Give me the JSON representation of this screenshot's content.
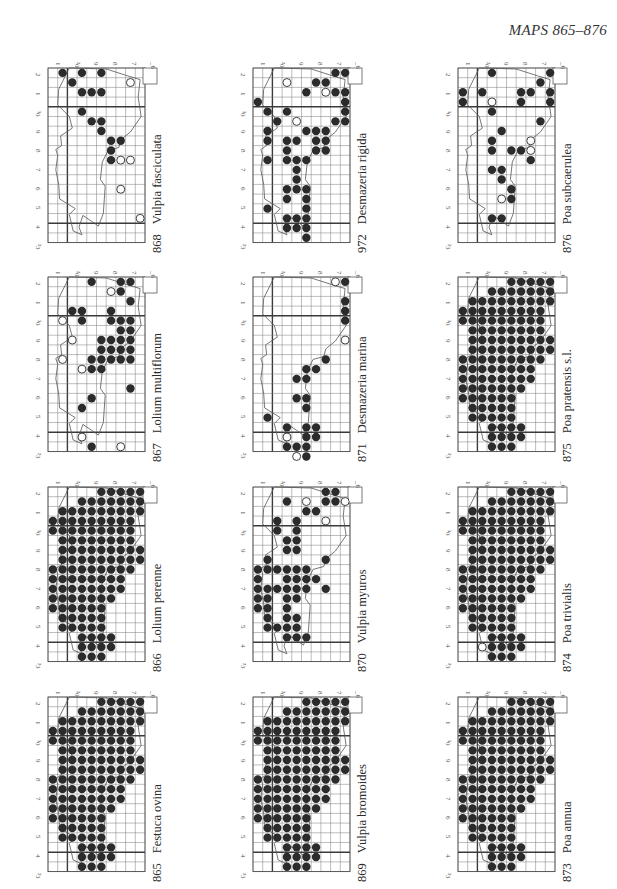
{
  "page": {
    "header": "MAPS 865–876",
    "colors": {
      "dot": "#2b2b2b",
      "grid": "#7a7a7a",
      "major_grid": "#3a3a3a",
      "coast": "#555555",
      "background": "#ffffff"
    }
  },
  "axes": {
    "left_labels": [
      "2",
      "1",
      "³0",
      "9",
      "8",
      "7",
      "6",
      "5",
      "4",
      "²3"
    ],
    "top_labels": [
      "1",
      "²0",
      "9",
      "8",
      "7",
      "_6"
    ]
  },
  "legend": {
    "filled_dot": "recorded (recent)",
    "open_dot": "recorded (old)"
  },
  "maps": [
    {
      "id": "868",
      "number": "868",
      "species": "Vulpia fasciculata",
      "col": 0,
      "row": 0,
      "filled": [
        [
          5,
          0
        ],
        [
          2,
          1
        ],
        [
          3,
          0
        ],
        [
          1,
          0
        ],
        [
          3,
          2
        ],
        [
          4,
          2
        ],
        [
          5,
          2
        ],
        [
          3,
          4
        ],
        [
          5,
          5
        ],
        [
          4,
          5
        ],
        [
          5,
          6
        ],
        [
          6,
          7
        ],
        [
          7,
          7
        ],
        [
          6,
          8
        ],
        [
          6,
          9
        ]
      ],
      "open": [
        [
          7,
          9
        ],
        [
          8,
          9
        ],
        [
          7,
          12
        ],
        [
          8,
          1
        ],
        [
          9,
          15
        ]
      ]
    },
    {
      "id": "867",
      "number": "867",
      "species": "Lolium multiflorum",
      "col": 0,
      "row": 1,
      "filled": [
        [
          4,
          17
        ],
        [
          3,
          13
        ],
        [
          4,
          12
        ],
        [
          4,
          9
        ],
        [
          5,
          9
        ],
        [
          4,
          8
        ],
        [
          5,
          8
        ],
        [
          6,
          8
        ],
        [
          7,
          8
        ],
        [
          8,
          8
        ],
        [
          8,
          11
        ],
        [
          5,
          7
        ],
        [
          6,
          7
        ],
        [
          7,
          7
        ],
        [
          8,
          7
        ],
        [
          5,
          6
        ],
        [
          6,
          6
        ],
        [
          7,
          6
        ],
        [
          8,
          6
        ],
        [
          7,
          5
        ],
        [
          8,
          5
        ],
        [
          3,
          4
        ],
        [
          6,
          4
        ],
        [
          7,
          4
        ],
        [
          8,
          4
        ],
        [
          2,
          3
        ],
        [
          3,
          3
        ],
        [
          6,
          3
        ],
        [
          8,
          2
        ],
        [
          7,
          1
        ],
        [
          8,
          0
        ],
        [
          4,
          0
        ],
        [
          7,
          0
        ]
      ],
      "open": [
        [
          1,
          8
        ],
        [
          2,
          6
        ],
        [
          1,
          4
        ],
        [
          3,
          9
        ],
        [
          7,
          17
        ],
        [
          3,
          16
        ],
        [
          6,
          1
        ]
      ]
    },
    {
      "id": "866",
      "number": "866",
      "species": "Lolium perenne",
      "col": 0,
      "row": 2,
      "dense": true
    },
    {
      "id": "865",
      "number": "865",
      "species": "Festuca ovina",
      "col": 0,
      "row": 3,
      "dense": true
    },
    {
      "id": "972",
      "number": "972",
      "species": "Desmazeria rigida",
      "col": 1,
      "row": 0,
      "filled": [
        [
          8,
          0
        ],
        [
          9,
          0
        ],
        [
          6,
          1
        ],
        [
          7,
          1
        ],
        [
          5,
          2
        ],
        [
          7,
          2
        ],
        [
          8,
          2
        ],
        [
          9,
          2
        ],
        [
          9,
          3
        ],
        [
          0,
          3
        ],
        [
          1,
          4
        ],
        [
          3,
          4
        ],
        [
          9,
          4
        ],
        [
          2,
          5
        ],
        [
          4,
          5
        ],
        [
          8,
          5
        ],
        [
          9,
          5
        ],
        [
          1,
          6
        ],
        [
          5,
          6
        ],
        [
          6,
          6
        ],
        [
          7,
          6
        ],
        [
          1,
          7
        ],
        [
          3,
          7
        ],
        [
          4,
          7
        ],
        [
          6,
          7
        ],
        [
          7,
          7
        ],
        [
          3,
          8
        ],
        [
          6,
          8
        ],
        [
          7,
          8
        ],
        [
          1,
          9
        ],
        [
          3,
          9
        ],
        [
          4,
          9
        ],
        [
          5,
          9
        ],
        [
          4,
          10
        ],
        [
          4,
          11
        ],
        [
          3,
          12
        ],
        [
          4,
          12
        ],
        [
          5,
          12
        ],
        [
          3,
          13
        ],
        [
          5,
          13
        ],
        [
          1,
          14
        ],
        [
          5,
          14
        ],
        [
          3,
          15
        ],
        [
          4,
          15
        ],
        [
          5,
          15
        ],
        [
          3,
          16
        ],
        [
          4,
          16
        ],
        [
          5,
          16
        ],
        [
          5,
          17
        ]
      ],
      "open": [
        [
          3,
          1
        ],
        [
          7,
          2
        ],
        [
          4,
          5
        ]
      ]
    },
    {
      "id": "871",
      "number": "871",
      "species": "Desmazeria marina",
      "col": 1,
      "row": 1,
      "filled": [
        [
          9,
          0
        ],
        [
          9,
          2
        ],
        [
          9,
          3
        ],
        [
          9,
          4
        ],
        [
          7,
          8
        ],
        [
          6,
          9
        ],
        [
          5,
          9
        ],
        [
          4,
          10
        ],
        [
          5,
          10
        ],
        [
          4,
          12
        ],
        [
          5,
          12
        ],
        [
          5,
          13
        ],
        [
          1,
          14
        ],
        [
          3,
          15
        ],
        [
          5,
          15
        ],
        [
          6,
          15
        ],
        [
          5,
          16
        ],
        [
          6,
          16
        ],
        [
          3,
          17
        ],
        [
          4,
          17
        ],
        [
          5,
          17
        ],
        [
          5,
          18
        ]
      ],
      "open": [
        [
          8,
          0
        ],
        [
          9,
          6
        ],
        [
          3,
          16
        ],
        [
          4,
          18
        ]
      ]
    },
    {
      "id": "870",
      "number": "870",
      "species": "Vulpia myuros",
      "col": 1,
      "row": 2,
      "filled": [
        [
          7,
          0
        ],
        [
          8,
          0
        ],
        [
          3,
          1
        ],
        [
          7,
          1
        ],
        [
          8,
          1
        ],
        [
          9,
          1
        ],
        [
          5,
          2
        ],
        [
          6,
          2
        ],
        [
          2,
          3
        ],
        [
          4,
          3
        ],
        [
          2,
          4
        ],
        [
          4,
          4
        ],
        [
          3,
          5
        ],
        [
          4,
          5
        ],
        [
          3,
          6
        ],
        [
          4,
          6
        ],
        [
          1,
          7
        ],
        [
          7,
          7
        ],
        [
          0,
          8
        ],
        [
          1,
          8
        ],
        [
          2,
          8
        ],
        [
          3,
          8
        ],
        [
          4,
          8
        ],
        [
          5,
          8
        ],
        [
          0,
          9
        ],
        [
          3,
          9
        ],
        [
          4,
          9
        ],
        [
          5,
          9
        ],
        [
          6,
          9
        ],
        [
          0,
          10
        ],
        [
          1,
          10
        ],
        [
          2,
          10
        ],
        [
          3,
          10
        ],
        [
          4,
          10
        ],
        [
          5,
          10
        ],
        [
          7,
          10
        ],
        [
          0,
          11
        ],
        [
          1,
          11
        ],
        [
          3,
          11
        ],
        [
          4,
          11
        ],
        [
          0,
          12
        ],
        [
          1,
          12
        ],
        [
          3,
          12
        ],
        [
          1,
          13
        ],
        [
          3,
          13
        ],
        [
          4,
          13
        ],
        [
          1,
          14
        ],
        [
          2,
          14
        ],
        [
          3,
          14
        ],
        [
          4,
          14
        ],
        [
          3,
          15
        ],
        [
          4,
          15
        ],
        [
          5,
          15
        ]
      ],
      "open": [
        [
          5,
          1
        ],
        [
          7,
          3
        ],
        [
          9,
          1
        ]
      ]
    },
    {
      "id": "869",
      "number": "869",
      "species": "Vulpia bromoides",
      "col": 1,
      "row": 3,
      "dense": true
    },
    {
      "id": "876",
      "number": "876",
      "species": "Poa subcaerulea",
      "col": 2,
      "row": 0,
      "filled": [
        [
          3,
          0
        ],
        [
          9,
          0
        ],
        [
          8,
          1
        ],
        [
          0,
          2
        ],
        [
          2,
          2
        ],
        [
          6,
          2
        ],
        [
          7,
          2
        ],
        [
          9,
          2
        ],
        [
          0,
          3
        ],
        [
          6,
          3
        ],
        [
          9,
          3
        ],
        [
          3,
          4
        ],
        [
          8,
          5
        ],
        [
          4,
          6
        ],
        [
          3,
          7
        ],
        [
          3,
          8
        ],
        [
          5,
          8
        ],
        [
          6,
          8
        ],
        [
          7,
          9
        ],
        [
          3,
          10
        ],
        [
          4,
          10
        ],
        [
          4,
          11
        ],
        [
          5,
          12
        ],
        [
          5,
          13
        ],
        [
          3,
          15
        ],
        [
          4,
          15
        ]
      ],
      "open": [
        [
          3,
          3
        ],
        [
          7,
          7
        ],
        [
          7,
          8
        ],
        [
          4,
          13
        ]
      ]
    },
    {
      "id": "875",
      "number": "875",
      "species": "Poa pratensis s.l.",
      "col": 2,
      "row": 1,
      "dense": true
    },
    {
      "id": "874",
      "number": "874",
      "species": "Poa trivialis",
      "col": 2,
      "row": 2,
      "dense": true,
      "open": [
        [
          2,
          16
        ]
      ]
    },
    {
      "id": "873",
      "number": "873",
      "species": "Poa annua",
      "col": 2,
      "row": 3,
      "dense": true
    }
  ]
}
